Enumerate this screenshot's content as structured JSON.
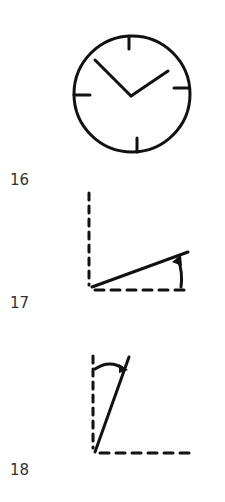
{
  "figures": [
    {
      "number": "16",
      "description": "clock face with hands"
    },
    {
      "number": "17",
      "description": "small angle measured from horizontal dashed line"
    },
    {
      "number": "18",
      "description": "small angle measured from vertical dashed line"
    }
  ],
  "colors": {
    "ink": "#111111",
    "label": "#333333",
    "background": "#ffffff"
  }
}
